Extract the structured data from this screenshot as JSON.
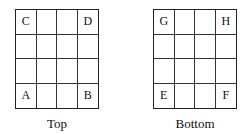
{
  "panels": [
    {
      "caption": "Top",
      "cells": [
        [
          "C",
          "",
          "",
          "D"
        ],
        [
          "",
          "",
          "",
          ""
        ],
        [
          "",
          "",
          "",
          ""
        ],
        [
          "A",
          "",
          "",
          "B"
        ]
      ]
    },
    {
      "caption": "Bottom",
      "cells": [
        [
          "G",
          "",
          "",
          "H"
        ],
        [
          "",
          "",
          "",
          ""
        ],
        [
          "",
          "",
          "",
          ""
        ],
        [
          "E",
          "",
          "",
          "F"
        ]
      ]
    }
  ]
}
